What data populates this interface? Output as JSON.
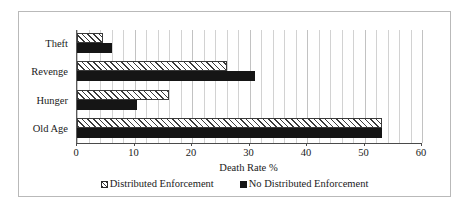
{
  "chart_data": {
    "type": "bar",
    "orientation": "horizontal",
    "title": "",
    "xlabel": "Death Rate %",
    "ylabel": "",
    "xlim": [
      0,
      60
    ],
    "xticks": [
      0,
      10,
      20,
      30,
      40,
      50,
      60
    ],
    "xtick_labels": [
      "0",
      "10",
      "20",
      "30",
      "40",
      "50",
      "60"
    ],
    "grid": true,
    "grid_axis": "x",
    "grid_minor_step": 2,
    "legend_position": "bottom",
    "categories": [
      "Theft",
      "Revenge",
      "Hunger",
      "Old Age"
    ],
    "series": [
      {
        "name": "Distributed Enforcement",
        "fill": "hatched",
        "color": "#ffffff",
        "values": [
          4.5,
          26,
          16,
          53
        ]
      },
      {
        "name": "No Distributed Enforcement",
        "fill": "solid",
        "color": "#151515",
        "values": [
          6,
          31,
          10.5,
          53
        ]
      }
    ]
  },
  "legend": {
    "entries": [
      {
        "label": "Distributed Enforcement",
        "swatch": "hatched-square-icon"
      },
      {
        "label": "No Distributed Enforcement",
        "swatch": "filled-square-icon"
      }
    ]
  },
  "axis": {
    "x_title": "Death Rate %"
  }
}
